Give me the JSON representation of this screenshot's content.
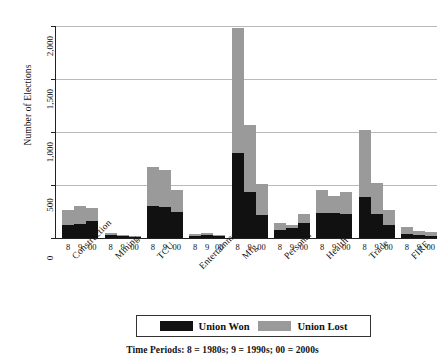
{
  "chart_data": {
    "type": "bar",
    "stacked": true,
    "title": "",
    "xlabel": "",
    "ylabel": "Number of Elections",
    "ylim": [
      0,
      2000
    ],
    "yticks": [
      0,
      500,
      1000,
      1500,
      2000
    ],
    "ytick_labels": [
      "0",
      "500",
      "1,000",
      "1,500",
      "2,000"
    ],
    "grid": true,
    "legend_position": "bottom",
    "categories": [
      "Construction",
      "Mining",
      "TCU",
      "Entertainment",
      "Mfg",
      "Personal",
      "Health",
      "Trade",
      "FIRE"
    ],
    "periods": [
      "8",
      "9",
      "00"
    ],
    "series": [
      {
        "name": "Union Won",
        "color": "#111111",
        "values": [
          [
            120,
            135,
            165
          ],
          [
            25,
            18,
            10
          ],
          [
            300,
            290,
            250
          ],
          [
            20,
            25,
            18
          ],
          [
            800,
            430,
            215
          ],
          [
            75,
            95,
            145
          ],
          [
            240,
            235,
            225
          ],
          [
            390,
            230,
            125
          ],
          [
            40,
            25,
            20
          ]
        ]
      },
      {
        "name": "Union Lost",
        "color": "#9a9a9a",
        "values": [
          [
            140,
            165,
            115
          ],
          [
            22,
            15,
            8
          ],
          [
            370,
            350,
            200
          ],
          [
            22,
            20,
            15
          ],
          [
            1180,
            640,
            290
          ],
          [
            65,
            25,
            85
          ],
          [
            210,
            165,
            205
          ],
          [
            630,
            290,
            140
          ],
          [
            65,
            45,
            40
          ]
        ]
      }
    ],
    "totals": [
      [
        260,
        300,
        280
      ],
      [
        47,
        33,
        18
      ],
      [
        670,
        640,
        450
      ],
      [
        42,
        45,
        33
      ],
      [
        1980,
        1070,
        505
      ],
      [
        140,
        120,
        230
      ],
      [
        450,
        400,
        430
      ],
      [
        1020,
        520,
        265
      ],
      [
        105,
        70,
        60
      ]
    ]
  },
  "legend": {
    "won_label": "Union Won",
    "lost_label": "Union Lost"
  },
  "caption": "Time Periods: 8 = 1980s;  9 = 1990s;  00 = 2000s"
}
